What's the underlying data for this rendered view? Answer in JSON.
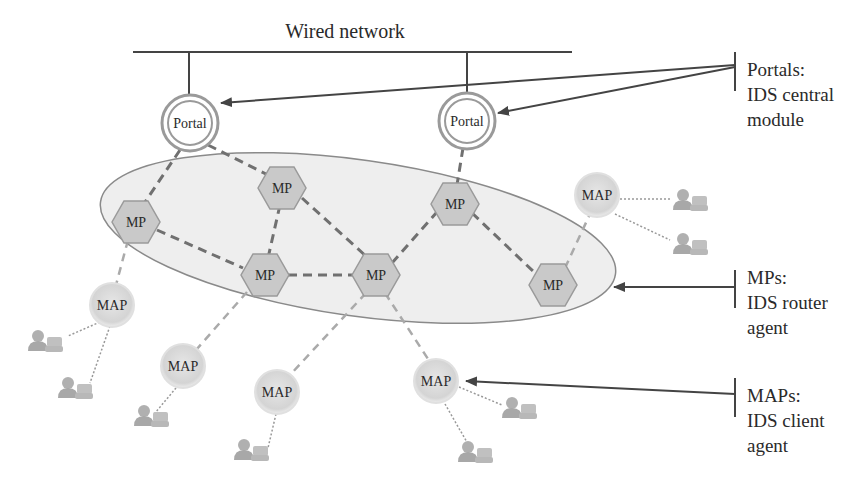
{
  "title": "Wired network",
  "colors": {
    "line": "#444444",
    "dashed": "#777777",
    "mp_fill": "#c9c9c9",
    "mp_stroke": "#999999",
    "ellipse_fill": "#ececec",
    "ellipse_stroke": "#8a8a8a",
    "map_fill": "#dcdcdc",
    "user_fill": "#b5b5b5"
  },
  "portals": [
    {
      "id": "portal-1",
      "label": "Portal",
      "x": 190,
      "y": 123
    },
    {
      "id": "portal-2",
      "label": "Portal",
      "x": 467,
      "y": 121
    }
  ],
  "mps": [
    {
      "id": "mp-1",
      "label": "MP",
      "x": 136,
      "y": 222
    },
    {
      "id": "mp-2",
      "label": "MP",
      "x": 282,
      "y": 188
    },
    {
      "id": "mp-3",
      "label": "MP",
      "x": 265,
      "y": 275
    },
    {
      "id": "mp-4",
      "label": "MP",
      "x": 376,
      "y": 275
    },
    {
      "id": "mp-5",
      "label": "MP",
      "x": 455,
      "y": 204
    },
    {
      "id": "mp-6",
      "label": "MP",
      "x": 553,
      "y": 285
    }
  ],
  "maps": [
    {
      "id": "map-1",
      "label": "MAP",
      "x": 112,
      "y": 305
    },
    {
      "id": "map-2",
      "label": "MAP",
      "x": 183,
      "y": 366
    },
    {
      "id": "map-3",
      "label": "MAP",
      "x": 277,
      "y": 392
    },
    {
      "id": "map-4",
      "label": "MAP",
      "x": 436,
      "y": 381
    },
    {
      "id": "map-5",
      "label": "MAP",
      "x": 597,
      "y": 195
    }
  ],
  "legend": {
    "portals": {
      "line1": "Portals:",
      "line2": "IDS central",
      "line3": "module"
    },
    "mps": {
      "line1": "MPs:",
      "line2": "IDS router",
      "line3": "agent"
    },
    "maps": {
      "line1": "MAPs:",
      "line2": "IDS client",
      "line3": "agent"
    }
  }
}
